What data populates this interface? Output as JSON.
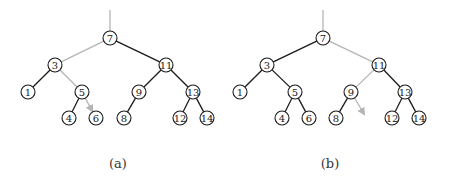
{
  "figure": {
    "panels": [
      {
        "id": "a",
        "caption": "(a)",
        "caption_x": 118,
        "nodes": [
          {
            "label": "7",
            "x": 110,
            "y": 38
          },
          {
            "label": "3",
            "x": 55,
            "y": 65
          },
          {
            "label": "11",
            "x": 166,
            "y": 65
          },
          {
            "label": "1",
            "x": 28,
            "y": 92
          },
          {
            "label": "5",
            "x": 82,
            "y": 92
          },
          {
            "label": "9",
            "x": 139,
            "y": 92
          },
          {
            "label": "13",
            "x": 193,
            "y": 92
          },
          {
            "label": "4",
            "x": 69,
            "y": 118
          },
          {
            "label": "6",
            "x": 96,
            "y": 118
          },
          {
            "label": "8",
            "x": 124,
            "y": 118
          },
          {
            "label": "12",
            "x": 180,
            "y": 118
          },
          {
            "label": "14",
            "x": 207,
            "y": 118
          }
        ],
        "edges": [
          {
            "from": [
              110,
              10
            ],
            "to": [
              110,
              31
            ],
            "style": "light"
          },
          {
            "from": "7",
            "to": "3",
            "style": "light"
          },
          {
            "from": "7",
            "to": "11",
            "style": "dark"
          },
          {
            "from": "3",
            "to": "1",
            "style": "dark"
          },
          {
            "from": "3",
            "to": "5",
            "style": "light"
          },
          {
            "from": "5",
            "to": "4",
            "style": "dark"
          },
          {
            "from": "5",
            "to": "6",
            "style": "light-arrow"
          },
          {
            "from": "11",
            "to": "9",
            "style": "dark"
          },
          {
            "from": "11",
            "to": "13",
            "style": "dark"
          },
          {
            "from": "9",
            "to": "8",
            "style": "dark"
          },
          {
            "from": "13",
            "to": "12",
            "style": "dark"
          },
          {
            "from": "13",
            "to": "14",
            "style": "dark"
          }
        ]
      },
      {
        "id": "b",
        "caption": "(b)",
        "caption_x": 330,
        "nodes": [
          {
            "label": "7",
            "x": 323,
            "y": 38
          },
          {
            "label": "3",
            "x": 267,
            "y": 65
          },
          {
            "label": "11",
            "x": 379,
            "y": 65
          },
          {
            "label": "1",
            "x": 240,
            "y": 92
          },
          {
            "label": "5",
            "x": 295,
            "y": 92
          },
          {
            "label": "9",
            "x": 351,
            "y": 92
          },
          {
            "label": "13",
            "x": 405,
            "y": 92
          },
          {
            "label": "4",
            "x": 282,
            "y": 118
          },
          {
            "label": "6",
            "x": 309,
            "y": 118
          },
          {
            "label": "8",
            "x": 336,
            "y": 118
          },
          {
            "label": "12",
            "x": 392,
            "y": 118
          },
          {
            "label": "14",
            "x": 419,
            "y": 118
          }
        ],
        "edges": [
          {
            "from": [
              323,
              10
            ],
            "to": [
              323,
              31
            ],
            "style": "light"
          },
          {
            "from": "7",
            "to": "3",
            "style": "dark"
          },
          {
            "from": "7",
            "to": "11",
            "style": "light"
          },
          {
            "from": "3",
            "to": "1",
            "style": "dark"
          },
          {
            "from": "3",
            "to": "5",
            "style": "dark"
          },
          {
            "from": "5",
            "to": "4",
            "style": "dark"
          },
          {
            "from": "5",
            "to": "6",
            "style": "dark"
          },
          {
            "from": "11",
            "to": "9",
            "style": "light"
          },
          {
            "from": "11",
            "to": "13",
            "style": "dark"
          },
          {
            "from": "9",
            "to": "8",
            "style": "dark"
          },
          {
            "from": "9",
            "to": [
              364,
              114
            ],
            "style": "light-arrow"
          },
          {
            "from": "13",
            "to": "12",
            "style": "dark"
          },
          {
            "from": "13",
            "to": "14",
            "style": "dark"
          }
        ]
      }
    ],
    "node_radius": 7,
    "colors": {
      "dark_edge": "#1a1a1a",
      "light_edge": "#b5b5b5",
      "node_stroke": "#1a1a1a",
      "background": "#ffffff"
    }
  }
}
